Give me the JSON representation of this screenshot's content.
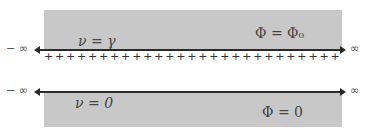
{
  "top_region": {
    "label_left": "ν = γ",
    "label_right": "Φ = Φ₀"
  },
  "bottom_region": {
    "label_left": "ν = 0",
    "label_right": "Φ = 0"
  },
  "axis": {
    "neg_inf": "− ∞",
    "pos_inf": "∞"
  },
  "charges": {
    "symbol": "+",
    "count": 27
  },
  "colors": {
    "region_fill": "#c8c8c8",
    "line": "#2a2a2a"
  }
}
